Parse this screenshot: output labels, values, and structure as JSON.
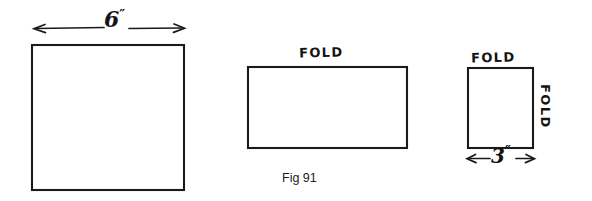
{
  "figure": {
    "caption": "Fig 91",
    "ink_color": "#1a1a1a",
    "background_color": "#ffffff",
    "panels": [
      {
        "name": "unfolded-sheet",
        "shape": "square",
        "dimension_label": "6",
        "dimension_unit": "″",
        "dimension_text": "6",
        "labels": []
      },
      {
        "name": "half-folded-sheet",
        "shape": "rectangle",
        "top_label": "FOLD",
        "labels": [
          "FOLD"
        ]
      },
      {
        "name": "quarter-folded-sheet",
        "shape": "square",
        "top_label": "FOLD",
        "side_label": "FOLD",
        "dimension_label": "3",
        "dimension_unit": "″",
        "dimension_text": "3",
        "labels": [
          "FOLD",
          "FOLD"
        ]
      }
    ]
  },
  "labels": {
    "fold_middle_top": "FOLD",
    "fold_right_top": "FOLD",
    "fold_right_side": "FOLD",
    "dim_six_value": "6",
    "dim_six_unit": "″",
    "dim_three_value": "3",
    "dim_three_unit": "″",
    "caption": "Fig 91"
  }
}
